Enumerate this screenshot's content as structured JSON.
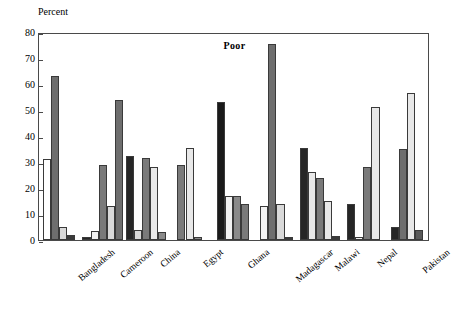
{
  "chart_data": {
    "type": "bar",
    "title": "Poor",
    "xlabel": "",
    "ylabel": "Percent",
    "ylim": [
      0,
      80
    ],
    "yticks": [
      0,
      10,
      20,
      30,
      40,
      50,
      60,
      70,
      80
    ],
    "grid": false,
    "legend": "none",
    "categories": [
      "Bangladesh",
      "Cameroon",
      "China",
      "Egypt",
      "Ghana",
      "Madagascar",
      "Malawi",
      "Nepal",
      "Pakistan"
    ],
    "series": [
      {
        "name": "series-1",
        "color": "#ffffff",
        "values": [
          31,
          1.2,
          32.5,
          29,
          53,
          13,
          35.5,
          14,
          5
        ]
      },
      {
        "name": "series-2",
        "color": "#6e6e6e",
        "values": [
          63,
          3.5,
          4,
          35.5,
          17,
          75.5,
          26,
          1,
          35
        ]
      },
      {
        "name": "series-3",
        "color": "#d9d9d9",
        "values": [
          5,
          29,
          31.5,
          1,
          17,
          14,
          24,
          28,
          56.5
        ]
      },
      {
        "name": "series-4",
        "color": "#3a3a3a",
        "values": [
          2,
          13,
          28,
          0,
          0,
          1,
          15,
          51,
          4
        ]
      },
      {
        "name": "series-5",
        "color": "#8a8a8a",
        "values": [
          0,
          54,
          3.2,
          0,
          0,
          0,
          1.5,
          0,
          0
        ]
      }
    ],
    "colors": {
      "white": "#ffffff",
      "dark_gray": "#6e6e6e",
      "light_gray": "#d9d9d9",
      "black": "#262626",
      "mid_gray": "#8a8a8a",
      "axis": "#4a4a4a",
      "text": "#000000"
    },
    "bars": [
      {
        "group": "Bangladesh",
        "index": 0,
        "value": 31,
        "fill": "#ffffff"
      },
      {
        "group": "Bangladesh",
        "index": 1,
        "value": 63,
        "fill": "#6e6e6e"
      },
      {
        "group": "Bangladesh",
        "index": 2,
        "value": 5,
        "fill": "#d9d9d9"
      },
      {
        "group": "Bangladesh",
        "index": 3,
        "value": 2,
        "fill": "#3a3a3a"
      },
      {
        "group": "Cameroon",
        "index": 0,
        "value": 1.2,
        "fill": "#262626"
      },
      {
        "group": "Cameroon",
        "index": 1,
        "value": 3.5,
        "fill": "#f2f2f2"
      },
      {
        "group": "Cameroon",
        "index": 2,
        "value": 29,
        "fill": "#7a7a7a"
      },
      {
        "group": "Cameroon",
        "index": 3,
        "value": 13,
        "fill": "#d9d9d9"
      },
      {
        "group": "Cameroon",
        "index": 4,
        "value": 54,
        "fill": "#6e6e6e"
      },
      {
        "group": "China",
        "index": 0,
        "value": 32.5,
        "fill": "#262626"
      },
      {
        "group": "China",
        "index": 1,
        "value": 4,
        "fill": "#d9d9d9"
      },
      {
        "group": "China",
        "index": 2,
        "value": 31.5,
        "fill": "#7a7a7a"
      },
      {
        "group": "China",
        "index": 3,
        "value": 28,
        "fill": "#e8e8e8"
      },
      {
        "group": "China",
        "index": 4,
        "value": 3.2,
        "fill": "#8a8a8a"
      },
      {
        "group": "Egypt",
        "index": 0,
        "value": 29,
        "fill": "#7a7a7a"
      },
      {
        "group": "Egypt",
        "index": 1,
        "value": 35.5,
        "fill": "#e8e8e8"
      },
      {
        "group": "Egypt",
        "index": 2,
        "value": 1,
        "fill": "#8a8a8a"
      },
      {
        "group": "Ghana",
        "index": 0,
        "value": 53,
        "fill": "#1a1a1a"
      },
      {
        "group": "Ghana",
        "index": 1,
        "value": 17,
        "fill": "#f2f2f2"
      },
      {
        "group": "Ghana",
        "index": 2,
        "value": 17,
        "fill": "#8a8a8a"
      },
      {
        "group": "Ghana",
        "index": 3,
        "value": 14,
        "fill": "#7a7a7a"
      },
      {
        "group": "Madagascar",
        "index": 0,
        "value": 13,
        "fill": "#f2f2f2"
      },
      {
        "group": "Madagascar",
        "index": 1,
        "value": 75.5,
        "fill": "#6e6e6e"
      },
      {
        "group": "Madagascar",
        "index": 2,
        "value": 14,
        "fill": "#d9d9d9"
      },
      {
        "group": "Madagascar",
        "index": 3,
        "value": 1,
        "fill": "#3a3a3a"
      },
      {
        "group": "Malawi",
        "index": 0,
        "value": 35.5,
        "fill": "#262626"
      },
      {
        "group": "Malawi",
        "index": 1,
        "value": 26,
        "fill": "#e8e8e8"
      },
      {
        "group": "Malawi",
        "index": 2,
        "value": 24,
        "fill": "#7a7a7a"
      },
      {
        "group": "Malawi",
        "index": 3,
        "value": 15,
        "fill": "#e8e8e8"
      },
      {
        "group": "Malawi",
        "index": 4,
        "value": 1.5,
        "fill": "#3a3a3a"
      },
      {
        "group": "Nepal",
        "index": 0,
        "value": 14,
        "fill": "#262626"
      },
      {
        "group": "Nepal",
        "index": 1,
        "value": 1,
        "fill": "#f2f2f2"
      },
      {
        "group": "Nepal",
        "index": 2,
        "value": 28,
        "fill": "#7a7a7a"
      },
      {
        "group": "Nepal",
        "index": 3,
        "value": 51,
        "fill": "#e8e8e8"
      },
      {
        "group": "Pakistan",
        "index": 0,
        "value": 5,
        "fill": "#262626"
      },
      {
        "group": "Pakistan",
        "index": 1,
        "value": 35,
        "fill": "#6e6e6e"
      },
      {
        "group": "Pakistan",
        "index": 2,
        "value": 56.5,
        "fill": "#e8e8e8"
      },
      {
        "group": "Pakistan",
        "index": 3,
        "value": 4,
        "fill": "#595959"
      }
    ]
  }
}
